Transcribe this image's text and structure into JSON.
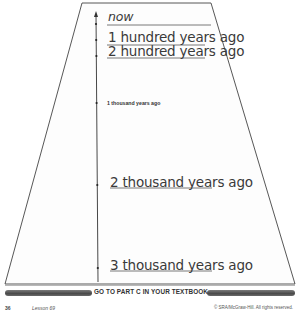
{
  "timeline": {
    "labels": [
      {
        "id": "now",
        "text": "now"
      },
      {
        "id": "1-hundred",
        "text": "1 hundred years ago"
      },
      {
        "id": "2-hundred",
        "text": "2 hundred years ago"
      },
      {
        "id": "1-thousand",
        "text": "1 thousand years ago"
      },
      {
        "id": "2-thousand",
        "text": "2 thousand years ago"
      },
      {
        "id": "3-thousand",
        "text": "3 thousand years ago"
      }
    ]
  },
  "footer": {
    "instruction": "GO TO PART C IN YOUR TEXTBOOK.",
    "page_number": "36",
    "lesson": "Lesson 69",
    "copyright": "© SRA/McGraw-Hill. All rights reserved."
  }
}
